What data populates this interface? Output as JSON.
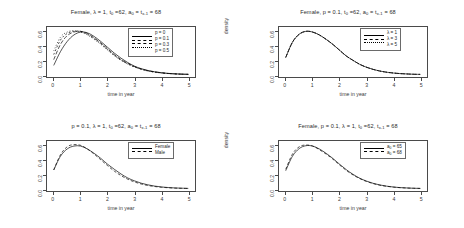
{
  "figure": {
    "background": "#ffffff",
    "line_color": "#000000",
    "axis_color": "#4a4a4a",
    "layout": "2x2 grid of density plots"
  },
  "axes_common": {
    "xlabel": "time in year",
    "ylabel": "density",
    "xticks": [
      "0",
      "1",
      "2",
      "3",
      "4",
      "5"
    ],
    "yticks": [
      "0.0",
      "0.2",
      "0.4",
      "0.6"
    ],
    "xlim": [
      -0.25,
      5.25
    ],
    "ylim": [
      -0.03,
      0.66
    ]
  },
  "panels": [
    {
      "id": "top-left",
      "title_html": "Female, λ = 1, t<sub>0</sub> =62, a<sub>0</sub> = t<sub>x-1</sub>  = 68",
      "title_plain": "Female, λ = 1, t0 =62, a0 = tx-1 = 68",
      "legend": {
        "position": "top-right",
        "entries": [
          {
            "label_plain": "p = 0",
            "label_html": "p = 0",
            "dash": "none"
          },
          {
            "label_plain": "p = 0.1",
            "label_html": "p = 0.1",
            "dash": "4,2"
          },
          {
            "label_plain": "p = 0.3",
            "label_html": "p = 0.3",
            "dash": "2,2"
          },
          {
            "label_plain": "p = 0.5",
            "label_html": "p = 0.5",
            "dash": "1,2"
          }
        ]
      }
    },
    {
      "id": "top-right",
      "title_html": "Female, p = 0.1, t<sub>0</sub> =62, a<sub>0</sub> = t<sub>x-1</sub>  = 68",
      "title_plain": "Female, p = 0.1, t0 =62, a0 = tx-1 = 68",
      "legend": {
        "position": "top-right",
        "entries": [
          {
            "label_plain": "λ = 1",
            "label_html": "λ = 1",
            "dash": "none"
          },
          {
            "label_plain": "λ = 3",
            "label_html": "λ = 3",
            "dash": "4,2"
          },
          {
            "label_plain": "λ = 5",
            "label_html": "λ = 5",
            "dash": "1,2"
          }
        ]
      }
    },
    {
      "id": "bottom-left",
      "title_html": "p = 0.1, λ = 1, t<sub>0</sub> =62, a<sub>0</sub> = t<sub>x-1</sub>  = 68",
      "title_plain": "p = 0.1, λ = 1, t0 =62, a0 = tx-1 = 68",
      "legend": {
        "position": "top-right",
        "entries": [
          {
            "label_plain": "Female",
            "label_html": "Female",
            "dash": "none"
          },
          {
            "label_plain": "Male",
            "label_html": "Male",
            "dash": "3,2"
          }
        ]
      }
    },
    {
      "id": "bottom-right",
      "title_html": "Female, p = 0.1, λ = 1, t<sub>0</sub> =62, t<sub>x-1</sub>  = 68",
      "title_plain": "Female, p = 0.1, λ = 1, t0 =62, tx-1 = 68",
      "legend": {
        "position": "top-right",
        "entries": [
          {
            "label_plain": "a₀ = 65",
            "label_html": "a<sub>0</sub> = 65",
            "dash": "none"
          },
          {
            "label_plain": "a₀ = 68",
            "label_html": "a<sub>0</sub> = 68",
            "dash": "3,2"
          }
        ]
      }
    }
  ],
  "chart_data": [
    {
      "type": "line",
      "panel": "top-left",
      "title": "Female, λ = 1, t0 =62, a0 = tx-1 = 68",
      "xlabel": "time in year",
      "ylabel": "density",
      "xlim": [
        0,
        5.2
      ],
      "ylim": [
        0,
        0.66
      ],
      "grid": false,
      "legend_position": "top-right",
      "x": [
        0,
        0.25,
        0.5,
        0.75,
        1,
        1.25,
        1.5,
        1.75,
        2,
        2.25,
        2.5,
        2.75,
        3,
        3.25,
        3.5,
        3.75,
        4,
        4.25,
        4.5,
        4.75,
        5
      ],
      "series": [
        {
          "name": "p = 0",
          "dash": "none",
          "values": [
            0.13,
            0.32,
            0.46,
            0.55,
            0.59,
            0.58,
            0.53,
            0.46,
            0.38,
            0.3,
            0.23,
            0.17,
            0.12,
            0.085,
            0.06,
            0.042,
            0.029,
            0.02,
            0.014,
            0.01,
            0.007
          ]
        },
        {
          "name": "p = 0.1",
          "dash": "4,2",
          "values": [
            0.21,
            0.42,
            0.54,
            0.59,
            0.6,
            0.57,
            0.51,
            0.44,
            0.36,
            0.28,
            0.21,
            0.16,
            0.115,
            0.081,
            0.057,
            0.04,
            0.028,
            0.019,
            0.013,
            0.009,
            0.007
          ]
        },
        {
          "name": "p = 0.3",
          "dash": "2,2",
          "values": [
            0.28,
            0.48,
            0.57,
            0.6,
            0.6,
            0.56,
            0.5,
            0.43,
            0.35,
            0.27,
            0.205,
            0.152,
            0.11,
            0.078,
            0.055,
            0.038,
            0.027,
            0.018,
            0.013,
            0.009,
            0.006
          ]
        },
        {
          "name": "p = 0.5",
          "dash": "1,2",
          "values": [
            0.33,
            0.52,
            0.59,
            0.61,
            0.59,
            0.55,
            0.49,
            0.42,
            0.34,
            0.265,
            0.2,
            0.148,
            0.107,
            0.076,
            0.053,
            0.037,
            0.026,
            0.018,
            0.012,
            0.008,
            0.006
          ]
        }
      ]
    },
    {
      "type": "line",
      "panel": "top-right",
      "title": "Female, p = 0.1, t0 =62, a0 = tx-1 = 68",
      "xlabel": "time in year",
      "ylabel": "density",
      "xlim": [
        0,
        5.2
      ],
      "ylim": [
        0,
        0.66
      ],
      "grid": false,
      "legend_position": "top-right",
      "x": [
        0,
        0.25,
        0.5,
        0.75,
        1,
        1.25,
        1.5,
        1.75,
        2,
        2.25,
        2.5,
        2.75,
        3,
        3.25,
        3.5,
        3.75,
        4,
        4.25,
        4.5,
        4.75,
        5
      ],
      "series": [
        {
          "name": "λ = 1",
          "dash": "none",
          "values": [
            0.24,
            0.45,
            0.56,
            0.6,
            0.59,
            0.55,
            0.49,
            0.42,
            0.34,
            0.26,
            0.2,
            0.145,
            0.105,
            0.075,
            0.052,
            0.036,
            0.025,
            0.017,
            0.012,
            0.008,
            0.006
          ]
        },
        {
          "name": "λ = 3",
          "dash": "4,2",
          "values": [
            0.24,
            0.45,
            0.56,
            0.6,
            0.59,
            0.55,
            0.49,
            0.42,
            0.34,
            0.26,
            0.2,
            0.145,
            0.105,
            0.075,
            0.052,
            0.036,
            0.025,
            0.017,
            0.012,
            0.008,
            0.006
          ]
        },
        {
          "name": "λ = 5",
          "dash": "1,2",
          "values": [
            0.24,
            0.45,
            0.56,
            0.6,
            0.59,
            0.55,
            0.49,
            0.42,
            0.34,
            0.26,
            0.2,
            0.145,
            0.105,
            0.075,
            0.052,
            0.036,
            0.025,
            0.017,
            0.012,
            0.008,
            0.006
          ]
        }
      ]
    },
    {
      "type": "line",
      "panel": "bottom-left",
      "title": "p = 0.1, λ = 1, t0 =62, a0 = tx-1 = 68",
      "xlabel": "time in year",
      "ylabel": "density",
      "xlim": [
        0,
        5.2
      ],
      "ylim": [
        0,
        0.66
      ],
      "grid": false,
      "legend_position": "top-right",
      "x": [
        0,
        0.25,
        0.5,
        0.75,
        1,
        1.25,
        1.5,
        1.75,
        2,
        2.25,
        2.5,
        2.75,
        3,
        3.25,
        3.5,
        3.75,
        4,
        4.25,
        4.5,
        4.75,
        5
      ],
      "series": [
        {
          "name": "Female",
          "dash": "none",
          "values": [
            0.26,
            0.45,
            0.55,
            0.59,
            0.59,
            0.55,
            0.49,
            0.42,
            0.34,
            0.27,
            0.205,
            0.15,
            0.11,
            0.078,
            0.055,
            0.038,
            0.026,
            0.018,
            0.012,
            0.009,
            0.006
          ]
        },
        {
          "name": "Male",
          "dash": "3,2",
          "values": [
            0.26,
            0.47,
            0.58,
            0.61,
            0.6,
            0.55,
            0.48,
            0.4,
            0.32,
            0.245,
            0.183,
            0.133,
            0.095,
            0.067,
            0.046,
            0.032,
            0.022,
            0.015,
            0.01,
            0.007,
            0.005
          ]
        }
      ]
    },
    {
      "type": "line",
      "panel": "bottom-right",
      "title": "Female, p = 0.1, λ = 1, t0 =62, tx-1 = 68",
      "xlabel": "time in year",
      "ylabel": "density",
      "xlim": [
        0,
        5.2
      ],
      "ylim": [
        0,
        0.66
      ],
      "grid": false,
      "legend_position": "top-right",
      "x": [
        0,
        0.25,
        0.5,
        0.75,
        1,
        1.25,
        1.5,
        1.75,
        2,
        2.25,
        2.5,
        2.75,
        3,
        3.25,
        3.5,
        3.75,
        4,
        4.25,
        4.5,
        4.75,
        5
      ],
      "series": [
        {
          "name": "a0 = 65",
          "dash": "none",
          "values": [
            0.25,
            0.45,
            0.555,
            0.595,
            0.59,
            0.55,
            0.49,
            0.42,
            0.34,
            0.265,
            0.2,
            0.147,
            0.107,
            0.076,
            0.053,
            0.037,
            0.025,
            0.017,
            0.012,
            0.008,
            0.006
          ]
        },
        {
          "name": "a0 = 68",
          "dash": "3,2",
          "values": [
            0.27,
            0.48,
            0.58,
            0.605,
            0.59,
            0.54,
            0.48,
            0.41,
            0.33,
            0.255,
            0.192,
            0.141,
            0.102,
            0.072,
            0.05,
            0.035,
            0.024,
            0.016,
            0.011,
            0.008,
            0.005
          ]
        }
      ]
    }
  ]
}
